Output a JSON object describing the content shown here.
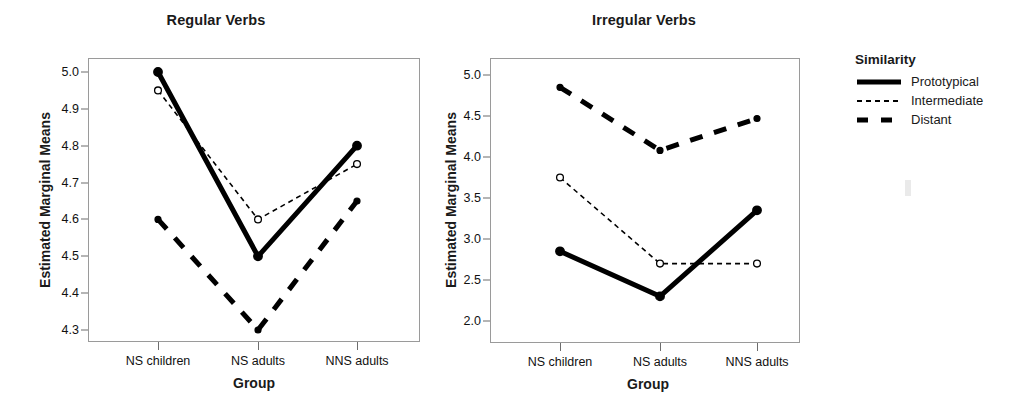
{
  "legend": {
    "title": "Similarity",
    "entries": [
      {
        "label": "Prototypical",
        "style": "solid-thick",
        "color": "#000000"
      },
      {
        "label": "Intermediate",
        "style": "dotted-thin",
        "color": "#000000"
      },
      {
        "label": "Distant",
        "style": "dashed-thick",
        "color": "#000000"
      }
    ]
  },
  "chart_data": [
    {
      "type": "line",
      "title": "Regular Verbs",
      "xlabel": "Group",
      "ylabel": "Estimated Marginal Means",
      "categories": [
        "NS children",
        "NS adults",
        "NNS adults"
      ],
      "ylim": [
        4.3,
        5.0
      ],
      "yticks": [
        "4.3",
        "4.4",
        "4.5",
        "4.6",
        "4.7",
        "4.8",
        "4.9",
        "5.0"
      ],
      "grid": false,
      "legend_position": "right-outside",
      "series": [
        {
          "name": "Prototypical",
          "values": [
            5.0,
            4.5,
            4.8
          ]
        },
        {
          "name": "Intermediate",
          "values": [
            4.95,
            4.6,
            4.75
          ]
        },
        {
          "name": "Distant",
          "values": [
            4.6,
            4.3,
            4.65
          ]
        }
      ]
    },
    {
      "type": "line",
      "title": "Irregular Verbs",
      "xlabel": "Group",
      "ylabel": "Estimated Marginal Means",
      "categories": [
        "NS children",
        "NS adults",
        "NNS adults"
      ],
      "ylim": [
        2.0,
        5.0
      ],
      "yticks": [
        "2.0",
        "2.5",
        "3.0",
        "3.5",
        "4.0",
        "4.5",
        "5.0"
      ],
      "grid": false,
      "legend_position": "right-outside",
      "series": [
        {
          "name": "Prototypical",
          "values": [
            2.85,
            2.3,
            3.35
          ]
        },
        {
          "name": "Intermediate",
          "values": [
            3.75,
            2.7,
            2.7
          ]
        },
        {
          "name": "Distant",
          "values": [
            4.85,
            4.08,
            4.47
          ]
        }
      ]
    }
  ]
}
